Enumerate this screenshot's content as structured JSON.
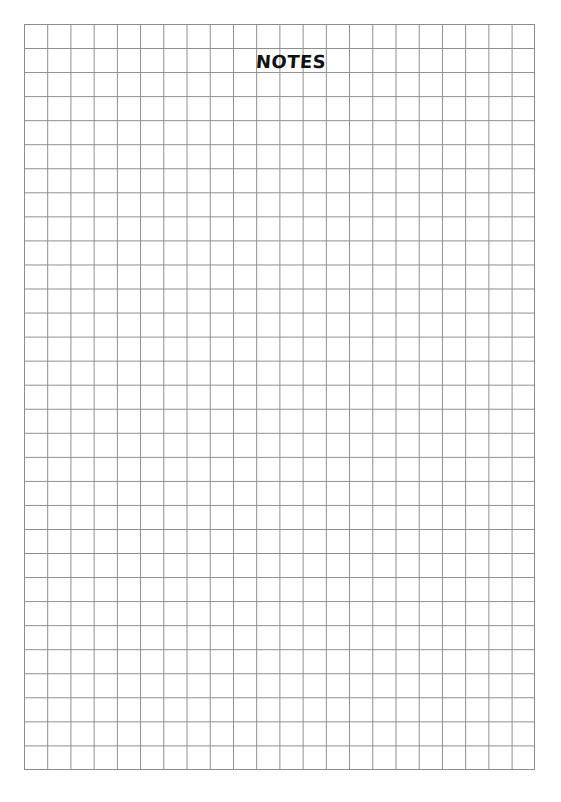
{
  "page": {
    "title": "NOTES",
    "grid": {
      "columns": 22,
      "rows": 31,
      "line_color": "#8c8c8c",
      "background_color": "#ffffff"
    }
  }
}
